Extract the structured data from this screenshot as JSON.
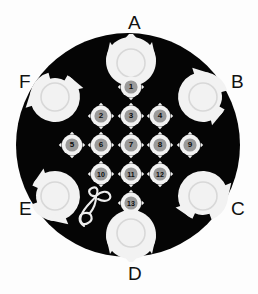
{
  "scene": {
    "title": "Fiducial calibration disc",
    "background_color": "#fdfdfd",
    "disc_color": "#050505",
    "marker_color": "#f2f2f2",
    "numeral_color": "#0c0c0c",
    "disc": {
      "cx": 128,
      "cy": 145,
      "r": 112
    }
  },
  "corner_labels": [
    {
      "id": "A",
      "label": "A",
      "position": "top"
    },
    {
      "id": "B",
      "label": "B",
      "position": "upper-right"
    },
    {
      "id": "C",
      "label": "C",
      "position": "lower-right"
    },
    {
      "id": "D",
      "label": "D",
      "position": "bottom"
    },
    {
      "id": "E",
      "label": "E",
      "position": "lower-left"
    },
    {
      "id": "F",
      "label": "F",
      "position": "upper-left"
    }
  ],
  "corner_markers": [
    {
      "id": "A",
      "cx": 131,
      "cy": 63,
      "r": 25,
      "style": "claw-crown",
      "rotation": 0
    },
    {
      "id": "B",
      "cx": 203,
      "cy": 97,
      "r": 25,
      "style": "spiral-hook",
      "rotation": 120
    },
    {
      "id": "C",
      "cx": 203,
      "cy": 196,
      "r": 25,
      "style": "spiral-hook",
      "rotation": 205
    },
    {
      "id": "D",
      "cx": 131,
      "cy": 233,
      "r": 25,
      "style": "claw-crown",
      "rotation": 180
    },
    {
      "id": "E",
      "cx": 55,
      "cy": 196,
      "r": 25,
      "style": "spiral-hook",
      "rotation": 295
    },
    {
      "id": "F",
      "cx": 55,
      "cy": 97,
      "r": 25,
      "style": "spiral-hook",
      "rotation": 30
    }
  ],
  "numbered_markers": [
    {
      "n": "1",
      "cx": 131,
      "cy": 87
    },
    {
      "n": "2",
      "cx": 101,
      "cy": 116
    },
    {
      "n": "3",
      "cx": 131,
      "cy": 116
    },
    {
      "n": "4",
      "cx": 160,
      "cy": 116
    },
    {
      "n": "5",
      "cx": 72,
      "cy": 145
    },
    {
      "n": "6",
      "cx": 101,
      "cy": 145
    },
    {
      "n": "7",
      "cx": 131,
      "cy": 145
    },
    {
      "n": "8",
      "cx": 160,
      "cy": 145
    },
    {
      "n": "9",
      "cx": 190,
      "cy": 145
    },
    {
      "n": "10",
      "cx": 101,
      "cy": 174
    },
    {
      "n": "11",
      "cx": 131,
      "cy": 174
    },
    {
      "n": "12",
      "cx": 160,
      "cy": 174
    },
    {
      "n": "13",
      "cx": 131,
      "cy": 203
    }
  ],
  "sprout_glyph": {
    "name": "sprout-glyph",
    "cx": 91,
    "cy": 210,
    "description": "thin white looped seedling with two leaves"
  }
}
